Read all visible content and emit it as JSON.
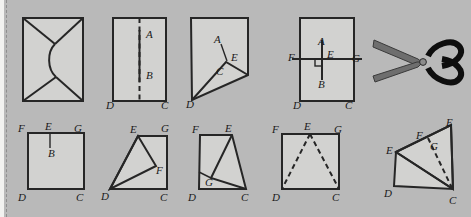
{
  "page": {
    "background_color": "#b9b9b9",
    "paper_color": "#d2d2d0",
    "ink_color": "#262626",
    "width": 471,
    "height": 217,
    "margin_rule": "dashed-vertical-left-margin"
  },
  "figures": [
    {
      "id": "fig-1",
      "name": "envelope-folded-rectangle",
      "row": "top",
      "order": 1,
      "shape": "rectangle-with-curved-flaps",
      "labels": []
    },
    {
      "id": "fig-2",
      "name": "rectangle-with-crease-AB",
      "row": "top",
      "order": 2,
      "shape": "rectangle-with-vertical-dashed-crease",
      "labels": [
        {
          "text": "A",
          "x": 150,
          "y": 35
        },
        {
          "text": "B",
          "x": 150,
          "y": 75
        },
        {
          "text": "D",
          "x": 112,
          "y": 103
        },
        {
          "text": "C",
          "x": 166,
          "y": 103
        }
      ]
    },
    {
      "id": "fig-3",
      "name": "folded-corner-quadrilateral-ACED",
      "row": "top",
      "order": 3,
      "shape": "quadrilateral-with-fold-at-E",
      "labels": [
        {
          "text": "A",
          "x": 217,
          "y": 40
        },
        {
          "text": "E",
          "x": 233,
          "y": 57
        },
        {
          "text": "C",
          "x": 219,
          "y": 71
        },
        {
          "text": "D",
          "x": 191,
          "y": 102
        }
      ]
    },
    {
      "id": "fig-4",
      "name": "rectangle-with-perpendicular-FG-AB",
      "row": "top",
      "order": 4,
      "shape": "rectangle-with-right-angle-marker-at-E",
      "labels": [
        {
          "text": "A",
          "x": 324,
          "y": 42
        },
        {
          "text": "F",
          "x": 295,
          "y": 58
        },
        {
          "text": "E",
          "x": 331,
          "y": 57
        },
        {
          "text": "G",
          "x": 357,
          "y": 60
        },
        {
          "text": "B",
          "x": 324,
          "y": 84
        },
        {
          "text": "D",
          "x": 298,
          "y": 103
        },
        {
          "text": "C",
          "x": 350,
          "y": 103
        }
      ]
    },
    {
      "id": "fig-scissors",
      "name": "scissors-illustration",
      "row": "top",
      "order": 5,
      "shape": "open-scissors-pointing-left",
      "labels": []
    },
    {
      "id": "fig-5",
      "name": "square-FGCD-with-segment-EB",
      "row": "bottom",
      "order": 6,
      "shape": "square-with-short-crease-from-E",
      "labels": [
        {
          "text": "F",
          "x": 22,
          "y": 128
        },
        {
          "text": "E",
          "x": 49,
          "y": 125
        },
        {
          "text": "G",
          "x": 78,
          "y": 128
        },
        {
          "text": "B",
          "x": 52,
          "y": 152
        },
        {
          "text": "D",
          "x": 22,
          "y": 197
        },
        {
          "text": "C",
          "x": 79,
          "y": 197
        }
      ]
    },
    {
      "id": "fig-6",
      "name": "quadrilateral-EGCD-with-triangle-DEF",
      "row": "bottom",
      "order": 7,
      "shape": "folded-square-with-triangle-DEF",
      "labels": [
        {
          "text": "E",
          "x": 134,
          "y": 130
        },
        {
          "text": "G",
          "x": 164,
          "y": 128
        },
        {
          "text": "F",
          "x": 153,
          "y": 168
        },
        {
          "text": "D",
          "x": 105,
          "y": 196
        },
        {
          "text": "C",
          "x": 163,
          "y": 197
        }
      ]
    },
    {
      "id": "fig-7",
      "name": "quadrilateral-FECD-with-point-G",
      "row": "bottom",
      "order": 8,
      "shape": "folded-square-with-interior-point-G",
      "labels": [
        {
          "text": "F",
          "x": 196,
          "y": 130
        },
        {
          "text": "E",
          "x": 228,
          "y": 129
        },
        {
          "text": "G",
          "x": 208,
          "y": 180
        },
        {
          "text": "D",
          "x": 192,
          "y": 198
        },
        {
          "text": "C",
          "x": 243,
          "y": 198
        }
      ]
    },
    {
      "id": "fig-8",
      "name": "square-FGCD-with-dashed-creases-to-E",
      "row": "bottom",
      "order": 9,
      "shape": "square-with-two-dashed-fold-lines",
      "labels": [
        {
          "text": "F",
          "x": 277,
          "y": 129
        },
        {
          "text": "E",
          "x": 308,
          "y": 126
        },
        {
          "text": "G",
          "x": 338,
          "y": 129
        },
        {
          "text": "D",
          "x": 276,
          "y": 198
        },
        {
          "text": "C",
          "x": 336,
          "y": 198
        }
      ]
    },
    {
      "id": "fig-9",
      "name": "folded-quadrilateral-EFGC-with-dashed-EC",
      "row": "bottom",
      "order": 10,
      "shape": "partially-folded-paper-with-dashed-crease",
      "labels": [
        {
          "text": "E",
          "x": 450,
          "y": 122
        },
        {
          "text": "F",
          "x": 421,
          "y": 136
        },
        {
          "text": "G",
          "x": 434,
          "y": 146
        },
        {
          "text": "E",
          "x": 391,
          "y": 151
        },
        {
          "text": "D",
          "x": 389,
          "y": 193
        },
        {
          "text": "C",
          "x": 451,
          "y": 201
        }
      ]
    }
  ]
}
